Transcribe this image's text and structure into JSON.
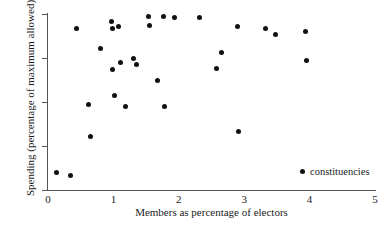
{
  "chart_data": {
    "type": "scatter",
    "title": "",
    "xlabel": "Members as percentage of electors",
    "ylabel": "Spending (percentage of maximum allowed)",
    "xlim": [
      0,
      5
    ],
    "ylim": [
      60,
      100
    ],
    "xticks": [
      "0",
      "1",
      "2",
      "3",
      "4",
      "5"
    ],
    "xtick_values": [
      0,
      1,
      2,
      3,
      4,
      5
    ],
    "yticks": [
      "60",
      "70",
      "80",
      "90",
      "100"
    ],
    "ytick_values": [
      60,
      70,
      80,
      90,
      100
    ],
    "grid": false,
    "legend_position": "lower right",
    "series": [
      {
        "name": "constituencies",
        "marker": "circle",
        "color": "#111111",
        "points": [
          [
            0.13,
            64.0
          ],
          [
            0.35,
            63.3
          ],
          [
            0.44,
            96.8
          ],
          [
            0.62,
            79.5
          ],
          [
            0.65,
            72.2
          ],
          [
            0.8,
            92.1
          ],
          [
            0.97,
            98.2
          ],
          [
            0.98,
            96.6
          ],
          [
            0.99,
            87.5
          ],
          [
            1.02,
            81.5
          ],
          [
            1.08,
            97.2
          ],
          [
            1.11,
            89.0
          ],
          [
            1.18,
            79.0
          ],
          [
            1.3,
            89.8
          ],
          [
            1.36,
            88.5
          ],
          [
            1.53,
            99.5
          ],
          [
            1.55,
            97.5
          ],
          [
            1.67,
            85.0
          ],
          [
            1.77,
            99.4
          ],
          [
            1.78,
            79.0
          ],
          [
            1.93,
            99.1
          ],
          [
            2.32,
            99.1
          ],
          [
            2.58,
            87.7
          ],
          [
            2.66,
            91.2
          ],
          [
            2.9,
            97.2
          ],
          [
            2.92,
            73.4
          ],
          [
            3.32,
            96.8
          ],
          [
            3.48,
            95.3
          ],
          [
            3.93,
            96.0
          ],
          [
            3.96,
            89.4
          ]
        ]
      }
    ]
  },
  "legend": {
    "entries": [
      {
        "label": "constituencies"
      }
    ]
  },
  "axes": {
    "x_title": "Members as percentage of electors",
    "y_title": "Spending (percentage of maximum allowed)"
  }
}
